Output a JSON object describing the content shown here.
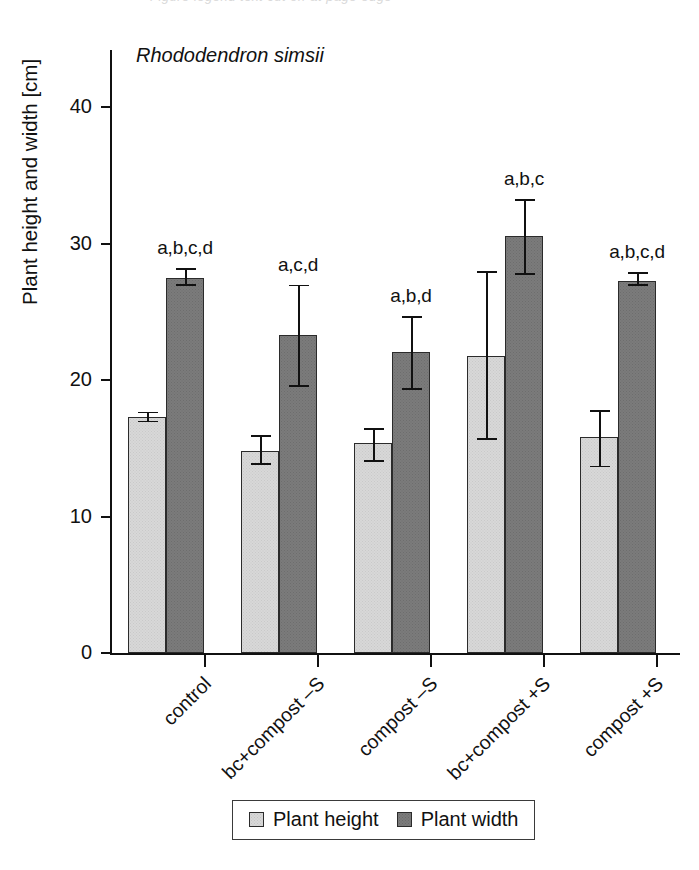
{
  "figure": {
    "title": "Rhododendron simsii",
    "top_cutoff_sliver": "descenders of a cut-off caption line"
  },
  "axes": {
    "y_title": "Plant height and width [cm]",
    "y_ticks": [
      "0",
      "10",
      "20",
      "30",
      "40"
    ],
    "y_tick_values": [
      0,
      10,
      20,
      30,
      40
    ],
    "y_min": 0,
    "y_max": 44.2,
    "x_categories": [
      "control",
      "bc+compost –S",
      "compost –S",
      "bc+compost +S",
      "compost +S"
    ]
  },
  "legend": {
    "items": [
      {
        "label": "Plant height",
        "swatch": "light-gray-dotted"
      },
      {
        "label": "Plant width",
        "swatch": "dark-gray-dotted"
      }
    ]
  },
  "annotations": {
    "significance": [
      "a,b,c,d",
      "a,c,d",
      "a,b,d",
      "a,b,c",
      "a,b,c,d"
    ]
  },
  "chart_data": {
    "type": "bar",
    "title": "Rhododendron simsii",
    "xlabel": "",
    "ylabel": "Plant height and width [cm]",
    "ylim": [
      0,
      44.2
    ],
    "yticks": [
      0,
      10,
      20,
      30,
      40
    ],
    "grid": false,
    "legend_position": "bottom-center",
    "categories": [
      "control",
      "bc+compost –S",
      "compost –S",
      "bc+compost +S",
      "compost +S"
    ],
    "series": [
      {
        "name": "Plant height",
        "color": "#d8d8d8",
        "values": [
          17.3,
          14.8,
          15.4,
          21.8,
          15.8
        ],
        "err_low": [
          16.9,
          13.8,
          14.0,
          15.6,
          13.6
        ],
        "err_high": [
          17.7,
          16.0,
          16.5,
          28.0,
          17.8
        ]
      },
      {
        "name": "Plant width",
        "color": "#7b7b7b",
        "values": [
          27.5,
          23.3,
          22.1,
          30.6,
          27.3
        ],
        "err_low": [
          26.9,
          19.5,
          19.3,
          27.7,
          26.9
        ],
        "err_high": [
          28.2,
          27.0,
          24.7,
          33.3,
          27.9
        ],
        "annotations": [
          "a,b,c,d",
          "a,c,d",
          "a,b,d",
          "a,b,c",
          "a,b,c,d"
        ]
      }
    ]
  }
}
